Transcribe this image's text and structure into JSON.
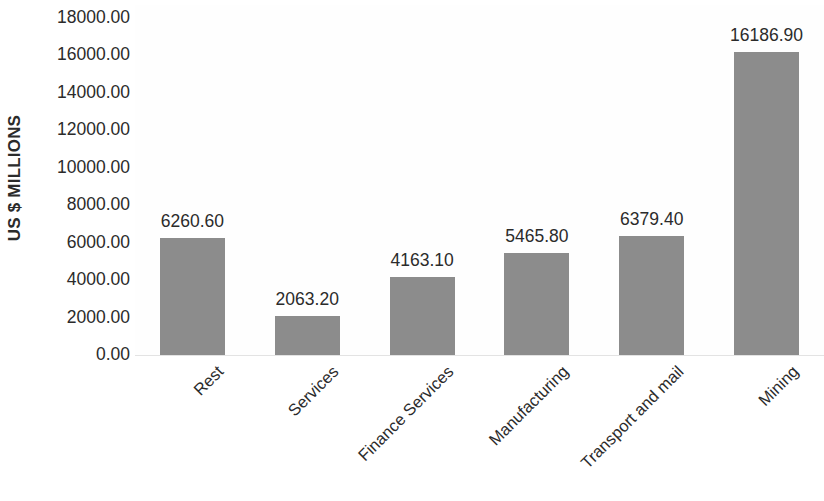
{
  "chart_data": {
    "type": "bar",
    "title": "",
    "xlabel": "",
    "ylabel": "US $ MILLIONS",
    "categories": [
      "Rest",
      "Services",
      "Finance Services",
      "Manufacturing",
      "Transport and mail",
      "Mining"
    ],
    "values": [
      6260.6,
      2063.2,
      4163.1,
      5465.8,
      6379.4,
      16186.9
    ],
    "value_labels": [
      "6260.60",
      "2063.20",
      "4163.10",
      "5465.80",
      "6379.40",
      "16186.90"
    ],
    "ylim": [
      0,
      18000
    ],
    "ytick_values": [
      0,
      2000,
      4000,
      6000,
      8000,
      10000,
      12000,
      14000,
      16000,
      18000
    ],
    "ytick_labels": [
      "0.00",
      "2000.00",
      "4000.00",
      "6000.00",
      "8000.00",
      "10000.00",
      "12000.00",
      "14000.00",
      "16000.00",
      "18000.00"
    ],
    "grid": false,
    "legend": false,
    "bar_color": "#8c8c8c",
    "text_color": "#2b2b2b",
    "axis_line_color": "#e3e3e3",
    "background_color": "#ffffff",
    "category_label_rotation": -45,
    "ylabel_rotation": -90
  }
}
